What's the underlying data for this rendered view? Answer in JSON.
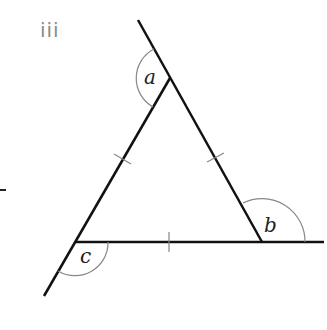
{
  "part_label": "iii",
  "diagram": {
    "type": "equilateral triangle with extended sides showing exterior angles",
    "angles": [
      {
        "id": "a",
        "label": "a"
      },
      {
        "id": "b",
        "label": "b"
      },
      {
        "id": "c",
        "label": "c"
      }
    ],
    "equal_side_marks": 3,
    "colors": {
      "lines": "#111111",
      "arcs": "#888888",
      "part_label": "#8a8a8a"
    }
  }
}
